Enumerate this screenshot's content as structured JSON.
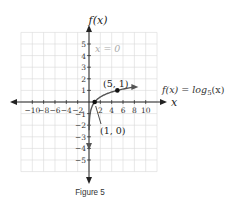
{
  "chart_data": {
    "type": "line",
    "title": "",
    "caption": "Figure 5",
    "xlabel": "x",
    "ylabel": "f(x)",
    "xlim": [
      -12,
      12
    ],
    "ylim": [
      -6,
      6
    ],
    "grid": true,
    "x_ticks": [
      -10,
      -8,
      -6,
      -4,
      -2,
      2,
      4,
      6,
      8,
      10
    ],
    "y_ticks": [
      -5,
      -4,
      -3,
      -2,
      -1,
      1,
      2,
      3,
      4,
      5
    ],
    "series": [
      {
        "name": "f(x) = log5(x)",
        "function": "log5(x)",
        "domain": [
          0.02,
          8
        ],
        "color": "#555555"
      }
    ],
    "points": [
      {
        "x": 1,
        "y": 0,
        "label": "(1, 0)"
      },
      {
        "x": 5,
        "y": 1,
        "label": "(5, 1)"
      }
    ],
    "annotations": [
      {
        "text": "x = 0",
        "note": "vertical asymptote label",
        "color": "#aaaaaa"
      },
      {
        "text": "f(x) = log5(x)",
        "note": "curve label"
      }
    ]
  },
  "labels": {
    "y_axis": "f(x)",
    "x_axis": "x",
    "asymptote": "x = 0",
    "function_prefix": "f(x) = log",
    "function_base": "5",
    "function_suffix": "(x)",
    "point_a": "(1, 0)",
    "point_b": "(5, 1)",
    "caption": "Figure 5"
  }
}
